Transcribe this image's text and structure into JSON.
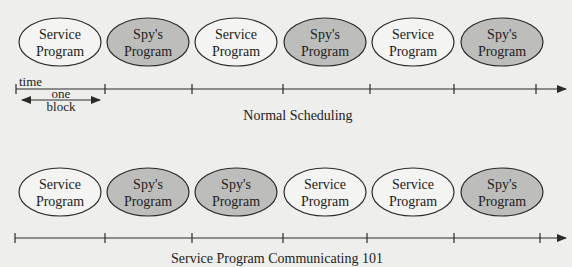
{
  "diagrams": [
    {
      "caption": "Normal Scheduling",
      "blocks": [
        {
          "line1": "Service",
          "line2": "Program",
          "type": "service"
        },
        {
          "line1": "Spy's",
          "line2": "Program",
          "type": "spy"
        },
        {
          "line1": "Service",
          "line2": "Program",
          "type": "service"
        },
        {
          "line1": "Spy's",
          "line2": "Program",
          "type": "spy"
        },
        {
          "line1": "Service",
          "line2": "Program",
          "type": "service"
        },
        {
          "line1": "Spy's",
          "line2": "Program",
          "type": "spy"
        }
      ],
      "axis_label": "time",
      "block_label_line1": "one",
      "block_label_line2": "block"
    },
    {
      "caption": "Service Program Communicating 101",
      "blocks": [
        {
          "line1": "Service",
          "line2": "Program",
          "type": "service"
        },
        {
          "line1": "Spy's",
          "line2": "Program",
          "type": "spy"
        },
        {
          "line1": "Spy's",
          "line2": "Program",
          "type": "spy"
        },
        {
          "line1": "Service",
          "line2": "Program",
          "type": "service"
        },
        {
          "line1": "Service",
          "line2": "Program",
          "type": "service"
        },
        {
          "line1": "Spy's",
          "line2": "Program",
          "type": "spy"
        }
      ]
    }
  ],
  "colors": {
    "service_fill": "#f4f4f2",
    "spy_fill": "#bdbdbb",
    "stroke": "#2a2a2a",
    "background": "#eeeeec"
  }
}
